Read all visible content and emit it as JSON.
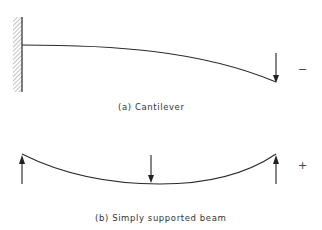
{
  "figure": {
    "panels": [
      {
        "id": "a",
        "caption": "(a) Cantilever",
        "sign": "−",
        "support": "fixed-wall",
        "loads": [
          {
            "type": "point-load",
            "direction": "down",
            "position": "free-end"
          }
        ]
      },
      {
        "id": "b",
        "caption": "(b) Simply supported beam",
        "sign": "+",
        "supports": [
          "left-reaction-up",
          "right-reaction-up"
        ],
        "loads": [
          {
            "type": "point-load",
            "direction": "down",
            "position": "midspan"
          }
        ]
      }
    ],
    "colors": {
      "line": "#2a2a2a",
      "hatch": "#777777",
      "text": "#333333"
    }
  }
}
